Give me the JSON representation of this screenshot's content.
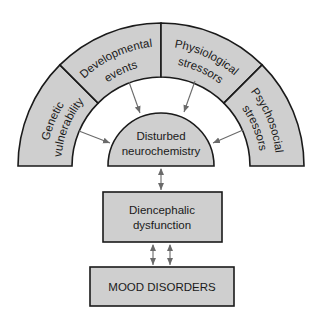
{
  "diagram": {
    "type": "flow",
    "ring_segments": [
      {
        "id": "genetic",
        "lines": [
          "Genetic",
          "vulnerability"
        ]
      },
      {
        "id": "developmental",
        "lines": [
          "Developmental",
          "events"
        ]
      },
      {
        "id": "physiological",
        "lines": [
          "Physiological",
          "stressors"
        ]
      },
      {
        "id": "psychosocial",
        "lines": [
          "Psychosocial",
          "stressors"
        ]
      }
    ],
    "center": {
      "lines": [
        "Disturbed",
        "neurochemistry"
      ]
    },
    "middle_box": {
      "lines": [
        "Diencephalic",
        "dysfunction"
      ]
    },
    "bottom_box": {
      "label": "MOOD DISORDERS"
    },
    "colors": {
      "fill": "#cfcfcf",
      "stroke": "#1a1a1a",
      "arrow": "#6a6a6a"
    },
    "edges": [
      {
        "from": "genetic",
        "to": "center",
        "type": "one-way"
      },
      {
        "from": "developmental",
        "to": "center",
        "type": "one-way"
      },
      {
        "from": "physiological",
        "to": "center",
        "type": "one-way"
      },
      {
        "from": "psychosocial",
        "to": "center",
        "type": "one-way"
      },
      {
        "from": "center",
        "to": "middle_box",
        "type": "two-way"
      },
      {
        "from": "middle_box",
        "to": "bottom_box",
        "type": "two-way",
        "count": 2
      }
    ]
  }
}
